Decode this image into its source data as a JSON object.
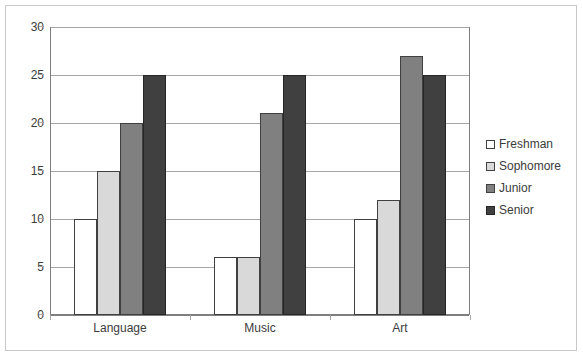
{
  "chart_data": {
    "type": "bar",
    "title": "",
    "subtitle": "",
    "xlabel": "",
    "ylabel": "",
    "categories": [
      "Language",
      "Music",
      "Art"
    ],
    "series": [
      {
        "name": "Freshman",
        "values": [
          10,
          6,
          10
        ],
        "color": "#FFFFFF",
        "border": "#404040"
      },
      {
        "name": "Sophomore",
        "values": [
          15,
          6,
          12
        ],
        "color": "#D9D9D9",
        "border": "#404040"
      },
      {
        "name": "Junior",
        "values": [
          20,
          21,
          27
        ],
        "color": "#808080",
        "border": "#404040"
      },
      {
        "name": "Senior",
        "values": [
          25,
          25,
          25
        ],
        "color": "#404040",
        "border": "#262626"
      }
    ],
    "ylim": [
      0,
      30
    ],
    "yticks": [
      0,
      5,
      10,
      15,
      20,
      25,
      30
    ],
    "ytick_labels": [
      "0",
      "5",
      "10",
      "15",
      "20",
      "25",
      "30"
    ],
    "grid": true,
    "grid_axis": "y",
    "legend_position": "right",
    "legend_entries": [
      "Freshman",
      "Sophomore",
      "Junior",
      "Senior"
    ],
    "bar_mode": "grouped",
    "plot_background": "#FFFFFF",
    "grid_color": "#A6A6A6",
    "axis_color": "#7F7F7F",
    "text_color": "#3B3B3B",
    "frame_border_color": "#C8C8C8"
  }
}
